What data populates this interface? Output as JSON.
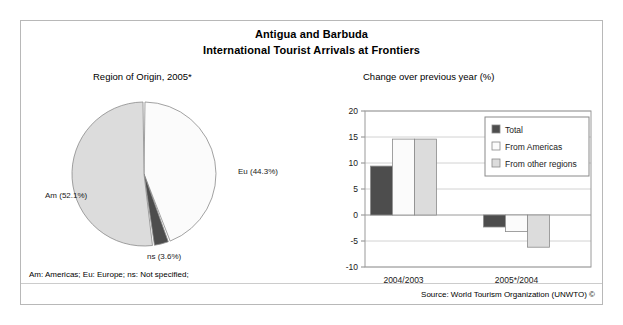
{
  "figure": {
    "title_line1": "Antigua and Barbuda",
    "title_line2": "International Tourist Arrivals at Frontiers",
    "footnote_legend": "Am: Americas; Eu: Europe; ns: Not specified;",
    "source": "Source: World Tourism Organization (UNWTO) ©"
  },
  "chart_data": [
    {
      "type": "pie",
      "title": "Region of Origin, 2005*",
      "categories": [
        "Eu",
        "Am",
        "ns"
      ],
      "labels": [
        "Eu (44.3%)",
        "Am (52.1%)",
        "ns (3.6%)"
      ],
      "values": [
        44.3,
        52.1,
        3.6
      ],
      "colors": [
        "#fbfbfb",
        "#dcdcdc",
        "#4d4d4d"
      ],
      "xlabel": "",
      "ylabel": "",
      "legend": "none",
      "grid": false
    },
    {
      "type": "bar",
      "title": "Change over previous year (%)",
      "categories": [
        "2004/2003",
        "2005*/2004"
      ],
      "series": [
        {
          "name": "Total",
          "values": [
            9.4,
            -2.3
          ],
          "color": "#4d4d4d"
        },
        {
          "name": "From Americas",
          "values": [
            14.6,
            -3.2
          ],
          "color": "#fbfbfb"
        },
        {
          "name": "From other regions",
          "values": [
            14.6,
            -6.2
          ],
          "color": "#dcdcdc"
        }
      ],
      "yticks": [
        20,
        15,
        10,
        5,
        0,
        -5,
        -10
      ],
      "ylim": [
        -10,
        20
      ],
      "xlabel": "",
      "ylabel": "",
      "legend": "top-right",
      "grid": true
    }
  ]
}
